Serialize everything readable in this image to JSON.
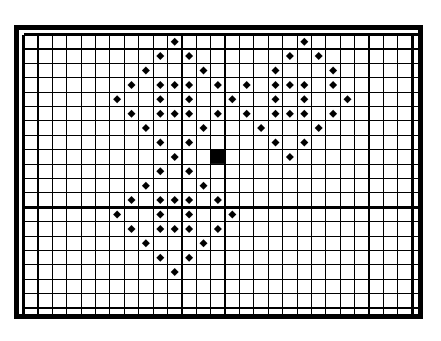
{
  "document": {
    "kind": "cross-stitch-chart",
    "title": "",
    "background_color": "#ffffff",
    "ink_color": "#000000"
  },
  "chart_data": {
    "type": "heatmap",
    "title": "",
    "subtitle": "",
    "xlabel": "",
    "ylabel": "",
    "grid": true,
    "legend_position": "none",
    "columns": 28,
    "rows": 20,
    "cell_size_px": 14.4,
    "origin_px": {
      "x": 4.5,
      "y": 4.5
    },
    "xlim": [
      0,
      28
    ],
    "ylim": [
      0,
      20
    ],
    "categories": [
      "empty",
      "diamond",
      "solid"
    ],
    "tick_labels": {
      "x": [],
      "y": []
    },
    "major_gridlines": {
      "columns": [
        0,
        1,
        11,
        14,
        24,
        27,
        28
      ],
      "rows": [
        0,
        1,
        12,
        19,
        20
      ]
    },
    "line_widths": {
      "minor": 1.1,
      "major": 2.6,
      "border": 5
    },
    "symbols": {
      "diamond": {
        "glyph": "◆",
        "color": "#000000",
        "size_px": 8
      },
      "solid": {
        "glyph": "■",
        "color": "#000000",
        "size_px": 14
      }
    },
    "marks": [
      {
        "col": 11,
        "row": 1,
        "symbol": "diamond"
      },
      {
        "col": 20,
        "row": 1,
        "symbol": "diamond"
      },
      {
        "col": 10,
        "row": 2,
        "symbol": "diamond"
      },
      {
        "col": 12,
        "row": 2,
        "symbol": "diamond"
      },
      {
        "col": 19,
        "row": 2,
        "symbol": "diamond"
      },
      {
        "col": 21,
        "row": 2,
        "symbol": "diamond"
      },
      {
        "col": 9,
        "row": 3,
        "symbol": "diamond"
      },
      {
        "col": 13,
        "row": 3,
        "symbol": "diamond"
      },
      {
        "col": 18,
        "row": 3,
        "symbol": "diamond"
      },
      {
        "col": 22,
        "row": 3,
        "symbol": "diamond"
      },
      {
        "col": 8,
        "row": 4,
        "symbol": "diamond"
      },
      {
        "col": 10,
        "row": 4,
        "symbol": "diamond"
      },
      {
        "col": 11,
        "row": 4,
        "symbol": "diamond"
      },
      {
        "col": 12,
        "row": 4,
        "symbol": "diamond"
      },
      {
        "col": 14,
        "row": 4,
        "symbol": "diamond"
      },
      {
        "col": 16,
        "row": 4,
        "symbol": "diamond"
      },
      {
        "col": 18,
        "row": 4,
        "symbol": "diamond"
      },
      {
        "col": 19,
        "row": 4,
        "symbol": "diamond"
      },
      {
        "col": 20,
        "row": 4,
        "symbol": "diamond"
      },
      {
        "col": 22,
        "row": 4,
        "symbol": "diamond"
      },
      {
        "col": 7,
        "row": 5,
        "symbol": "diamond"
      },
      {
        "col": 10,
        "row": 5,
        "symbol": "diamond"
      },
      {
        "col": 12,
        "row": 5,
        "symbol": "diamond"
      },
      {
        "col": 15,
        "row": 5,
        "symbol": "diamond"
      },
      {
        "col": 18,
        "row": 5,
        "symbol": "diamond"
      },
      {
        "col": 20,
        "row": 5,
        "symbol": "diamond"
      },
      {
        "col": 23,
        "row": 5,
        "symbol": "diamond"
      },
      {
        "col": 8,
        "row": 6,
        "symbol": "diamond"
      },
      {
        "col": 10,
        "row": 6,
        "symbol": "diamond"
      },
      {
        "col": 11,
        "row": 6,
        "symbol": "diamond"
      },
      {
        "col": 12,
        "row": 6,
        "symbol": "diamond"
      },
      {
        "col": 14,
        "row": 6,
        "symbol": "diamond"
      },
      {
        "col": 16,
        "row": 6,
        "symbol": "diamond"
      },
      {
        "col": 18,
        "row": 6,
        "symbol": "diamond"
      },
      {
        "col": 19,
        "row": 6,
        "symbol": "diamond"
      },
      {
        "col": 20,
        "row": 6,
        "symbol": "diamond"
      },
      {
        "col": 22,
        "row": 6,
        "symbol": "diamond"
      },
      {
        "col": 9,
        "row": 7,
        "symbol": "diamond"
      },
      {
        "col": 13,
        "row": 7,
        "symbol": "diamond"
      },
      {
        "col": 17,
        "row": 7,
        "symbol": "diamond"
      },
      {
        "col": 21,
        "row": 7,
        "symbol": "diamond"
      },
      {
        "col": 10,
        "row": 8,
        "symbol": "diamond"
      },
      {
        "col": 12,
        "row": 8,
        "symbol": "diamond"
      },
      {
        "col": 18,
        "row": 8,
        "symbol": "diamond"
      },
      {
        "col": 20,
        "row": 8,
        "symbol": "diamond"
      },
      {
        "col": 11,
        "row": 9,
        "symbol": "diamond"
      },
      {
        "col": 14,
        "row": 9,
        "symbol": "solid"
      },
      {
        "col": 19,
        "row": 9,
        "symbol": "diamond"
      },
      {
        "col": 10,
        "row": 10,
        "symbol": "diamond"
      },
      {
        "col": 12,
        "row": 10,
        "symbol": "diamond"
      },
      {
        "col": 9,
        "row": 11,
        "symbol": "diamond"
      },
      {
        "col": 13,
        "row": 11,
        "symbol": "diamond"
      },
      {
        "col": 8,
        "row": 12,
        "symbol": "diamond"
      },
      {
        "col": 10,
        "row": 12,
        "symbol": "diamond"
      },
      {
        "col": 11,
        "row": 12,
        "symbol": "diamond"
      },
      {
        "col": 12,
        "row": 12,
        "symbol": "diamond"
      },
      {
        "col": 14,
        "row": 12,
        "symbol": "diamond"
      },
      {
        "col": 7,
        "row": 13,
        "symbol": "diamond"
      },
      {
        "col": 10,
        "row": 13,
        "symbol": "diamond"
      },
      {
        "col": 12,
        "row": 13,
        "symbol": "diamond"
      },
      {
        "col": 15,
        "row": 13,
        "symbol": "diamond"
      },
      {
        "col": 8,
        "row": 14,
        "symbol": "diamond"
      },
      {
        "col": 10,
        "row": 14,
        "symbol": "diamond"
      },
      {
        "col": 11,
        "row": 14,
        "symbol": "diamond"
      },
      {
        "col": 12,
        "row": 14,
        "symbol": "diamond"
      },
      {
        "col": 14,
        "row": 14,
        "symbol": "diamond"
      },
      {
        "col": 9,
        "row": 15,
        "symbol": "diamond"
      },
      {
        "col": 13,
        "row": 15,
        "symbol": "diamond"
      },
      {
        "col": 10,
        "row": 16,
        "symbol": "diamond"
      },
      {
        "col": 12,
        "row": 16,
        "symbol": "diamond"
      },
      {
        "col": 11,
        "row": 17,
        "symbol": "diamond"
      }
    ]
  }
}
